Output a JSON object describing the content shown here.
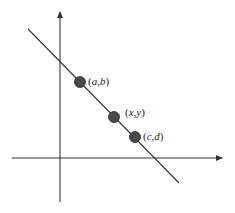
{
  "diagram": {
    "title": "",
    "type": "line through three points on coordinate axes",
    "colors": {
      "axis": "#333333",
      "line": "#333333",
      "point_fill": "#4a4a4a",
      "point_stroke": "#2a2a2a",
      "label": "#222222"
    },
    "axes": {
      "x_axis": {
        "y": 158,
        "x_start": 12,
        "x_end": 222,
        "arrow": "right"
      },
      "y_axis": {
        "x": 60,
        "y_start": 202,
        "y_end": 12,
        "arrow": "up"
      }
    },
    "line": {
      "x1": 28,
      "y1": 29,
      "x2": 179,
      "y2": 183
    },
    "points": [
      {
        "name": "point-a-b",
        "cx": 80,
        "cy": 82,
        "r": 5.5,
        "label_open": "(",
        "label_v1": "a",
        "label_sep": ",",
        "label_v2": "b",
        "label_close": ")",
        "label_x": 88,
        "label_y": 85
      },
      {
        "name": "point-x-y",
        "cx": 114,
        "cy": 117,
        "r": 5.5,
        "label_open": "(",
        "label_v1": "x",
        "label_sep": ",",
        "label_v2": "y",
        "label_close": ")",
        "label_x": 125,
        "label_y": 116
      },
      {
        "name": "point-c-d",
        "cx": 135,
        "cy": 137,
        "r": 5.5,
        "label_open": "(",
        "label_v1": "c",
        "label_sep": ",",
        "label_v2": "d",
        "label_close": ")",
        "label_x": 143,
        "label_y": 140
      }
    ]
  }
}
